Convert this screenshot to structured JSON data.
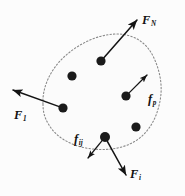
{
  "figure": {
    "type": "physics-free-body-diagram",
    "background_color": "#fcfcfc",
    "boundary": {
      "style": "dotted",
      "color": "#8a8a8a",
      "fill_color": "#fbfbfb",
      "path": "M 43 104 C 42 88, 50 70, 64 57 C 78 44, 98 34, 117 34 C 133 34, 146 42, 153 56 C 160 70, 163 86, 160 101 C 157 117, 150 131, 137 140 C 122 150, 103 151, 86 148 C 70 145, 56 137, 49 125 C 44 117, 43 111, 43 104 Z"
    },
    "particles": [
      {
        "name": "particle-upper-left",
        "cx": 72,
        "cy": 76,
        "r": 4.6
      },
      {
        "name": "particle-top",
        "cx": 101,
        "cy": 61,
        "r": 4.6
      },
      {
        "name": "particle-left",
        "cx": 63,
        "cy": 108,
        "r": 4.6
      },
      {
        "name": "particle-right",
        "cx": 126,
        "cy": 96,
        "r": 4.6
      },
      {
        "name": "particle-lower-right",
        "cx": 136,
        "cy": 127,
        "r": 4.6
      },
      {
        "name": "particle-bottom",
        "cx": 105,
        "cy": 137,
        "r": 5.0
      }
    ],
    "particle_color": "#1a1a1a",
    "vectors": [
      {
        "id": "F_N",
        "label_base": "F",
        "label_sub": "N",
        "kind": "external-force",
        "from_x": 101,
        "from_y": 61,
        "to_x": 137,
        "to_y": 20
      },
      {
        "id": "F_1",
        "label_base": "F",
        "label_sub": "1",
        "kind": "external-force",
        "from_x": 63,
        "from_y": 108,
        "to_x": 13,
        "to_y": 90
      },
      {
        "id": "f_p",
        "label_base": "f",
        "label_sub": "p",
        "kind": "internal-force",
        "from_x": 126,
        "from_y": 96,
        "to_x": 147,
        "to_y": 75
      },
      {
        "id": "f_ij",
        "label_base": "f",
        "label_sub": "ij",
        "kind": "internal-force",
        "from_x": 105,
        "from_y": 137,
        "to_x": 88,
        "to_y": 158
      },
      {
        "id": "F_i",
        "label_base": "F",
        "label_sub": "i",
        "kind": "external-force",
        "from_x": 105,
        "from_y": 137,
        "to_x": 126,
        "to_y": 175
      }
    ],
    "vector_color": "#141414",
    "labels": {
      "f_n": {
        "base": "F",
        "sub": "N"
      },
      "f_1": {
        "base": "F",
        "sub": "1"
      },
      "f_p": {
        "base": "f",
        "sub": "p"
      },
      "f_ij": {
        "base": "f",
        "sub": "ij"
      },
      "f_i": {
        "base": "F",
        "sub": "i"
      }
    }
  }
}
